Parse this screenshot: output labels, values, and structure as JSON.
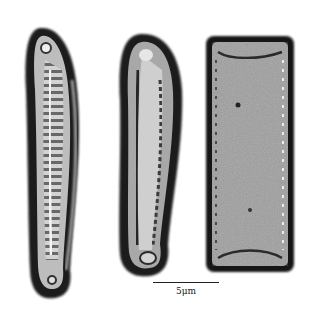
{
  "image": {
    "description": "Light micrograph of three diatom frustules on white background",
    "background": "#ffffff"
  },
  "specimens": [
    {
      "name": "left-diatom",
      "shape": "arcuate valve with transverse striae",
      "bbox": [
        18,
        25,
        85,
        300
      ]
    },
    {
      "name": "middle-diatom",
      "shape": "slightly curved elongate valve",
      "bbox": [
        115,
        33,
        185,
        275
      ]
    },
    {
      "name": "right-diatom",
      "shape": "rectangular girdle view",
      "bbox": [
        205,
        35,
        295,
        272
      ]
    }
  ],
  "scale_bar": {
    "label": "5μm",
    "x_start": 153,
    "x_end": 219,
    "y": 282
  }
}
